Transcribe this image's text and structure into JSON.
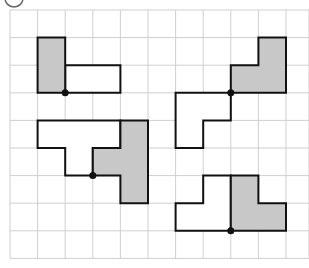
{
  "diagram": {
    "label_mark": "②",
    "grid": {
      "origin_x": 10,
      "origin_y": 10,
      "cell": 27.6,
      "cols": 11,
      "rows": 9,
      "right_edge": 309,
      "line_color": "#cfcfcf"
    },
    "colors": {
      "shaded": "#c8c8c8",
      "outline": "#111111",
      "dot": "#111111"
    },
    "figures": [
      {
        "name": "figure-top-left",
        "shaded": [
          [
            1,
            1
          ],
          [
            2,
            1
          ],
          [
            2,
            3
          ],
          [
            1,
            3
          ]
        ],
        "white": [
          [
            2,
            2
          ],
          [
            4,
            2
          ],
          [
            4,
            3
          ],
          [
            2,
            3
          ]
        ],
        "dot": [
          2,
          3
        ]
      },
      {
        "name": "figure-top-right",
        "shaded": [
          [
            9,
            1
          ],
          [
            10,
            1
          ],
          [
            10,
            3
          ],
          [
            8,
            3
          ],
          [
            8,
            2
          ],
          [
            9,
            2
          ]
        ],
        "white": [
          [
            6,
            3
          ],
          [
            8,
            3
          ],
          [
            8,
            4
          ],
          [
            7,
            4
          ],
          [
            7,
            5
          ],
          [
            6,
            5
          ]
        ],
        "dot": [
          8,
          3
        ]
      },
      {
        "name": "figure-bottom-left",
        "shaded": [
          [
            4,
            4
          ],
          [
            5,
            4
          ],
          [
            5,
            7
          ],
          [
            4,
            7
          ],
          [
            4,
            6
          ],
          [
            3,
            6
          ],
          [
            3,
            5
          ],
          [
            4,
            5
          ]
        ],
        "white": [
          [
            1,
            4
          ],
          [
            4,
            4
          ],
          [
            4,
            5
          ],
          [
            3,
            5
          ],
          [
            3,
            6
          ],
          [
            2,
            6
          ],
          [
            2,
            5
          ],
          [
            1,
            5
          ]
        ],
        "dot": [
          3,
          6
        ]
      },
      {
        "name": "figure-bottom-right",
        "shaded": [
          [
            8,
            6
          ],
          [
            9,
            6
          ],
          [
            9,
            7
          ],
          [
            10,
            7
          ],
          [
            10,
            8
          ],
          [
            8,
            8
          ]
        ],
        "white": [
          [
            6,
            8
          ],
          [
            8,
            8
          ],
          [
            8,
            6
          ],
          [
            7,
            6
          ],
          [
            7,
            7
          ],
          [
            6,
            7
          ]
        ],
        "dot": [
          8,
          8
        ]
      }
    ]
  }
}
